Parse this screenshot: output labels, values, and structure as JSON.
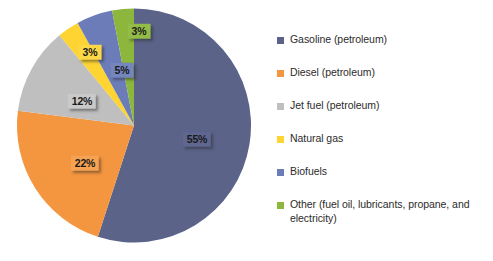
{
  "chart_data": {
    "type": "pie",
    "title": "",
    "subtitle": "",
    "xlabel": "",
    "ylabel": "",
    "legend_position": "right",
    "grid": false,
    "start_angle_deg": 0,
    "direction": "clockwise",
    "categories": [
      "Gasoline (petroleum)",
      "Diesel (petroleum)",
      "Jet fuel (petroleum)",
      "Natural gas",
      "Biofuels",
      "Other (fuel oil, lubricants, propane, and electricity)"
    ],
    "values": [
      55,
      22,
      12,
      3,
      5,
      3
    ],
    "data_labels": [
      "55%",
      "22%",
      "12%",
      "3%",
      "5%",
      "3%"
    ],
    "colors": [
      "#5b6389",
      "#f4953f",
      "#bfbfbf",
      "#fdd431",
      "#6b7cb8",
      "#8cb63c"
    ],
    "slices": [
      {
        "name": "Gasoline (petroleum)",
        "value": 55,
        "label": "55%",
        "color": "#5b6389",
        "label_bg": "#5f6790",
        "label_x": 197,
        "label_y": 139
      },
      {
        "name": "Diesel (petroleum)",
        "value": 22,
        "label": "22%",
        "color": "#f4953f",
        "label_bg": "#f5a252",
        "label_x": 85,
        "label_y": 163
      },
      {
        "name": "Jet fuel (petroleum)",
        "value": 12,
        "label": "12%",
        "color": "#bfbfbf",
        "label_bg": "#c9c9c9",
        "label_x": 82,
        "label_y": 101
      },
      {
        "name": "Natural gas",
        "value": 3,
        "label": "3%",
        "color": "#fdd431",
        "label_bg": "#fcd847",
        "label_x": 90,
        "label_y": 52
      },
      {
        "name": "Biofuels",
        "value": 5,
        "label": "5%",
        "color": "#6b7cb8",
        "label_bg": "#7486bd",
        "label_x": 122,
        "label_y": 70
      },
      {
        "name": "Other (fuel oil, lubricants, propane, and electricity)",
        "value": 3,
        "label": "3%",
        "color": "#8cb63c",
        "label_bg": "#93bb48",
        "label_x": 139,
        "label_y": 31
      }
    ]
  },
  "legend": {
    "items": [
      {
        "label": "Gasoline (petroleum)",
        "color": "#5b6389"
      },
      {
        "label": "Diesel (petroleum)",
        "color": "#f4953f"
      },
      {
        "label": "Jet fuel (petroleum)",
        "color": "#bfbfbf"
      },
      {
        "label": "Natural gas",
        "color": "#fdd431"
      },
      {
        "label": "Biofuels",
        "color": "#6b7cb8"
      },
      {
        "label": "Other (fuel oil, lubricants, propane, and electricity)",
        "color": "#8cb63c"
      }
    ]
  }
}
